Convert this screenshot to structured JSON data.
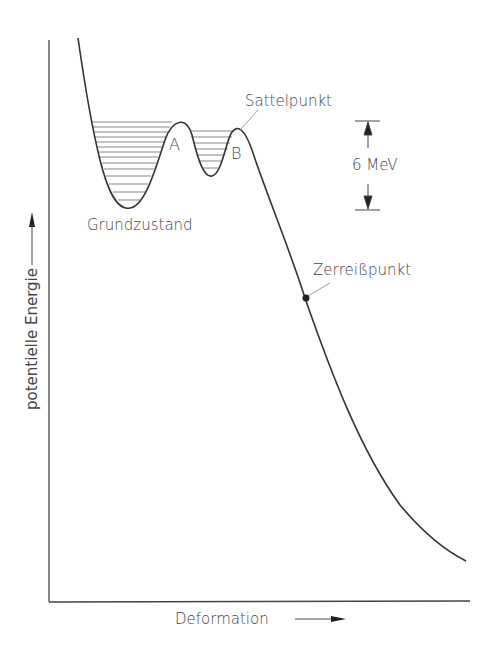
{
  "diagram": {
    "axes": {
      "x_label": "Deformation",
      "y_label": "potentielle Energie"
    },
    "labels": {
      "ground_state": "Grundzustand",
      "peak_a": "A",
      "peak_b": "B",
      "saddle_point": "Sattelpunkt",
      "scission_point": "Zerreißpunkt",
      "energy_scale": "6 MeV"
    },
    "colors": {
      "line": "#333333",
      "background": "#ffffff"
    }
  }
}
